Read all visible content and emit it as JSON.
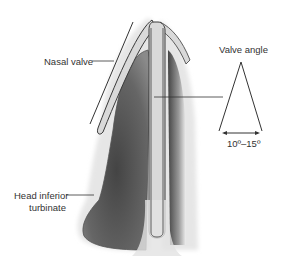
{
  "labels": {
    "nasal_valve": "Nasal valve",
    "valve_angle": "Valve angle",
    "angle_range": "10º–15º",
    "head_inferior_turbinate_line1": "Head inferior",
    "head_inferior_turbinate_line2": "turbinate"
  },
  "colors": {
    "cartilage_fill": "#d9d9d9",
    "turbinate_dark": "#555555",
    "outline": "#3a3a3a",
    "line": "#333333"
  }
}
